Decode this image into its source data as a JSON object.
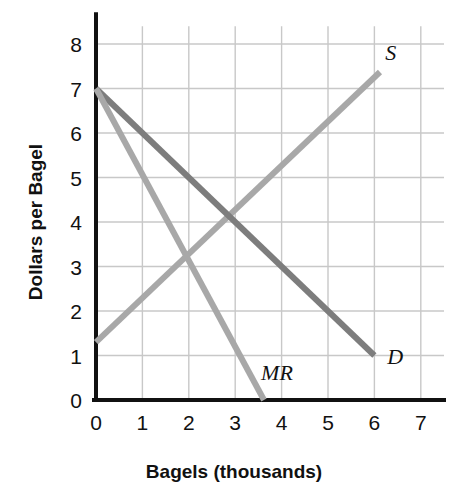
{
  "chart_data": {
    "type": "line",
    "title": "",
    "subtitle": "",
    "xlabel": "Bagels (thousands)",
    "ylabel": "Dollars per Bagel",
    "xlim": [
      0,
      7.5
    ],
    "ylim": [
      0,
      8.4
    ],
    "xticks": [
      0,
      1,
      2,
      3,
      4,
      5,
      6,
      7
    ],
    "xtick_labels": [
      "0",
      "1",
      "2",
      "3",
      "4",
      "5",
      "6",
      "7"
    ],
    "yticks": [
      0,
      1,
      2,
      3,
      4,
      5,
      6,
      7,
      8
    ],
    "ytick_labels": [
      "0",
      "1",
      "2",
      "3",
      "4",
      "5",
      "6",
      "7",
      "8"
    ],
    "grid": true,
    "grid_color": "#c8c8c8",
    "axis_color": "#111111",
    "background": "#ffffff",
    "legend_position": "inline-end-labels",
    "annotations": [
      {
        "text": "S",
        "x": 6.35,
        "y": 7.65
      },
      {
        "text": "D",
        "x": 6.45,
        "y": 0.82
      },
      {
        "text": "MR",
        "x": 3.9,
        "y": 0.45
      }
    ],
    "series": [
      {
        "name": "S",
        "label": "S",
        "color": "#a8a8a8",
        "width": 6,
        "points": [
          {
            "x": 0,
            "y": 1.3
          },
          {
            "x": 6.12,
            "y": 7.37
          }
        ],
        "description": "Supply curve, upward sloping"
      },
      {
        "name": "D",
        "label": "D",
        "color": "#7d7d7d",
        "width": 6,
        "points": [
          {
            "x": 0,
            "y": 7
          },
          {
            "x": 6,
            "y": 1
          }
        ],
        "description": "Demand curve, downward sloping"
      },
      {
        "name": "MR",
        "label": "MR",
        "color": "#a8a8a8",
        "width": 6,
        "points": [
          {
            "x": 0,
            "y": 7
          },
          {
            "x": 3.62,
            "y": 0
          }
        ],
        "description": "Marginal revenue curve, twice as steep as demand"
      }
    ],
    "intersections": [
      {
        "series": [
          "S",
          "D"
        ],
        "x": 3,
        "y": 4,
        "note": "competitive equilibrium"
      },
      {
        "series": [
          "S",
          "MR"
        ],
        "x": 2,
        "y": 3,
        "note": "monopoly output level"
      }
    ]
  }
}
